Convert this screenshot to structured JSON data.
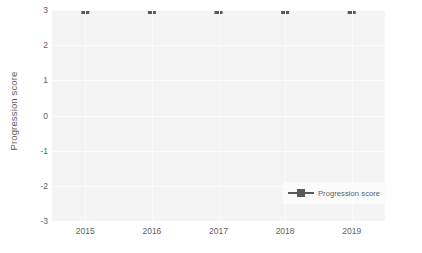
{
  "chart_data": {
    "type": "line",
    "title": "",
    "subtitle": "",
    "xlabel": "",
    "ylabel": "Progression score",
    "x": [
      "2015",
      "2016",
      "2017",
      "2018",
      "2019"
    ],
    "categories": [
      "2015",
      "2016",
      "2017",
      "2018",
      "2019"
    ],
    "xtick_labels": [
      "2015",
      "2016",
      "2017",
      "2018",
      "2019"
    ],
    "ytick_labels": [
      "3",
      "2",
      "1",
      "0",
      "-1",
      "-2",
      "-3"
    ],
    "ytick_values": [
      3,
      2,
      1,
      0,
      -1,
      -2,
      -3
    ],
    "ylim": [
      -3,
      3
    ],
    "grid": true,
    "legend_position": "lower-right-inside",
    "series": [
      {
        "name": "Progression score",
        "values": [
          3,
          3,
          3,
          3,
          3
        ],
        "color": "#595959",
        "marker": "square",
        "line_style": "solid"
      }
    ],
    "annotations": []
  },
  "legend": {
    "entries": [
      {
        "label": "Progression score"
      }
    ]
  },
  "colors": {
    "plot_background": "#f4f4f4",
    "figure_background": "#ffffff",
    "gridline": "#fdfdfd",
    "series": "#595959",
    "tick_text": "#606163",
    "axis_title_text": "#5a5b5d"
  }
}
